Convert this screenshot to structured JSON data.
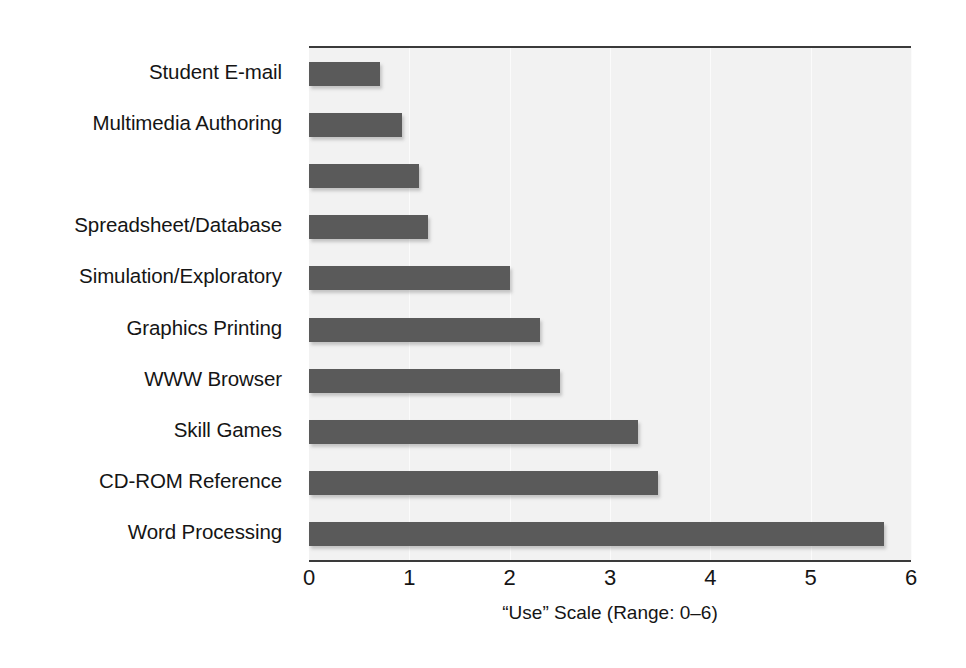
{
  "chart_data": {
    "type": "bar",
    "orientation": "horizontal",
    "title": "",
    "xlabel": "“Use” Scale (Range: 0–6)",
    "ylabel": "",
    "xlim": [
      0,
      6
    ],
    "xticks": [
      "0",
      "1",
      "2",
      "3",
      "4",
      "5",
      "6"
    ],
    "grid": true,
    "grid_axis": "x",
    "legend": "none",
    "bar_color": "#5a5a5a",
    "plot_background": "#f2f2f2",
    "categories": [
      "Student E-mail",
      "Multimedia Authoring",
      "",
      "Spreadsheet/Database",
      "Simulation/Exploratory",
      "Graphics Printing",
      "WWW Browser",
      "Skill Games",
      "CD-ROM Reference",
      "Word Processing"
    ],
    "values": [
      0.71,
      0.93,
      1.1,
      1.19,
      2.0,
      2.3,
      2.5,
      3.28,
      3.48,
      5.73
    ],
    "note": "Third category label is blank/illegible in the scanned source image"
  }
}
